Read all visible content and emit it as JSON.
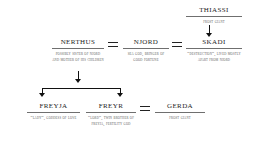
{
  "diagram": {
    "type": "genealogy-chart",
    "background_color": "#ffffff",
    "text_color": "#1e1e1e",
    "rule_color": "#6f6f6f",
    "connector_color": "#111111"
  },
  "people": {
    "thiassi": {
      "name": "Thiassi",
      "description": "Frost giant"
    },
    "nerthus": {
      "name": "Nerthus",
      "description": "Possibly sister of Njord and mother of his children"
    },
    "njord": {
      "name": "Njord",
      "description": "Sea god, bringer of good fortune"
    },
    "skadi": {
      "name": "Skadi",
      "description": "“Destruction”, lived mostly apart from Njord"
    },
    "freyja": {
      "name": "Freyja",
      "description": "“Lady”, goddess of love"
    },
    "freyr": {
      "name": "Freyr",
      "description": "“Lord”, twin brother of Freyja, fertility god"
    },
    "gerda": {
      "name": "Gerda",
      "description": "Frost giant"
    }
  },
  "relationships": {
    "marriage_symbol": "=",
    "marriages": [
      {
        "left": "Nerthus",
        "right": "Njord"
      },
      {
        "left": "Njord",
        "right": "Skadi"
      },
      {
        "left": "Freyr",
        "right": "Gerda"
      }
    ],
    "descents": [
      {
        "parent": "Thiassi",
        "child": "Skadi"
      },
      {
        "parents": "Nerthus and Njord",
        "children": "Freyja and Freyr"
      }
    ]
  }
}
